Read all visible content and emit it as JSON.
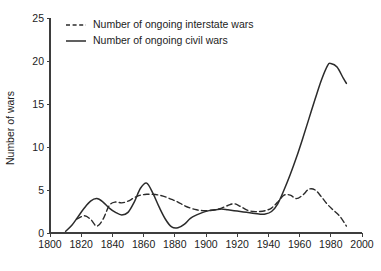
{
  "chart_data": {
    "type": "line",
    "title": "",
    "subtitle": "",
    "xlabel": "",
    "ylabel": "Number of wars",
    "xlim": [
      1800,
      2000
    ],
    "ylim": [
      0,
      25
    ],
    "xticks": [
      1800,
      1820,
      1840,
      1860,
      1880,
      1900,
      1920,
      1940,
      1960,
      1980,
      2000
    ],
    "yticks": [
      0,
      5,
      10,
      15,
      20,
      25
    ],
    "xtick_labels": [
      "1800",
      "1820",
      "1840",
      "1860",
      "1880",
      "1900",
      "1920",
      "1940",
      "1960",
      "1980",
      "2000"
    ],
    "ytick_labels": [
      "0",
      "5",
      "10",
      "15",
      "20",
      "25"
    ],
    "grid": false,
    "legend_position": "top-left",
    "series": [
      {
        "name": "Number of ongoing interstate wars",
        "style": "dashed",
        "color": "#2b2b2b",
        "x": [
          1817,
          1822,
          1826,
          1830,
          1834,
          1838,
          1842,
          1846,
          1850,
          1854,
          1858,
          1862,
          1866,
          1870,
          1874,
          1878,
          1882,
          1886,
          1890,
          1894,
          1898,
          1902,
          1906,
          1910,
          1914,
          1918,
          1922,
          1926,
          1930,
          1934,
          1938,
          1942,
          1946,
          1950,
          1954,
          1958,
          1962,
          1966,
          1970,
          1974,
          1978,
          1982,
          1986,
          1990
        ],
        "y": [
          1.6,
          2.0,
          1.6,
          0.8,
          1.6,
          3.2,
          3.6,
          3.5,
          3.7,
          4.1,
          4.4,
          4.5,
          4.5,
          4.4,
          4.2,
          3.9,
          3.6,
          3.2,
          2.9,
          2.7,
          2.6,
          2.6,
          2.7,
          2.9,
          3.2,
          3.4,
          3.1,
          2.7,
          2.5,
          2.5,
          2.6,
          2.9,
          3.6,
          4.4,
          4.4,
          4.0,
          4.4,
          5.1,
          5.0,
          4.2,
          3.3,
          2.6,
          1.9,
          0.8
        ]
      },
      {
        "name": "Number of ongoing civil wars",
        "style": "solid",
        "color": "#2b2b2b",
        "x": [
          1810,
          1814,
          1818,
          1822,
          1826,
          1830,
          1834,
          1838,
          1842,
          1846,
          1850,
          1854,
          1858,
          1862,
          1866,
          1870,
          1874,
          1878,
          1882,
          1886,
          1890,
          1894,
          1898,
          1902,
          1906,
          1910,
          1914,
          1918,
          1922,
          1926,
          1930,
          1934,
          1938,
          1942,
          1946,
          1950,
          1954,
          1958,
          1962,
          1966,
          1970,
          1974,
          1978,
          1980,
          1984,
          1988,
          1990
        ],
        "y": [
          0.2,
          0.9,
          1.9,
          2.9,
          3.7,
          4.0,
          3.6,
          2.9,
          2.4,
          2.1,
          2.4,
          3.6,
          5.2,
          5.8,
          4.6,
          3.0,
          1.6,
          0.7,
          0.6,
          1.0,
          1.7,
          2.1,
          2.4,
          2.6,
          2.7,
          2.8,
          2.7,
          2.6,
          2.5,
          2.4,
          2.3,
          2.2,
          2.2,
          2.5,
          3.4,
          5.0,
          6.8,
          8.8,
          11.0,
          13.3,
          15.6,
          17.8,
          19.5,
          19.7,
          19.3,
          18.0,
          17.4
        ]
      }
    ],
    "legend": [
      {
        "label": "Number of ongoing interstate wars",
        "style": "dashed"
      },
      {
        "label": "Number of ongoing civil wars",
        "style": "solid"
      }
    ],
    "annotations": []
  },
  "colors": {
    "background": "#ffffff",
    "axis": "#3d3d3d",
    "line": "#2b2b2b",
    "text": "#1c1c1c"
  }
}
